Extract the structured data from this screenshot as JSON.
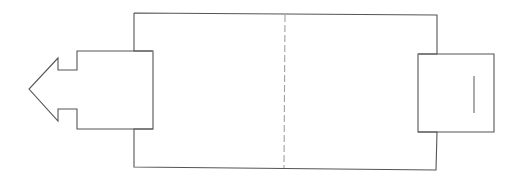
{
  "diagram": {
    "title": "",
    "colors": {
      "background": "#ffffff",
      "stroke": "#555555",
      "dashed_stroke": "#a0a0a0",
      "marker_stroke": "#666666"
    },
    "main_box": {
      "points": "134,13 437,15 437,54 418,54 418,132 437,132 436,170 134,167 134,129 153,129 153,51 134,51 134,13",
      "center_fold_line": {
        "x1": 285,
        "y1": 15,
        "x2": 284,
        "y2": 168
      }
    },
    "left_arrow_tab": {
      "outline": "153,51 77,51 77,70 58,70 58,58 29,89 58,121 58,109 77,109 77,129 153,129",
      "fold_line": {
        "x1": 153,
        "y1": 51,
        "x2": 153,
        "y2": 129
      }
    },
    "right_tab": {
      "outline": "418,54 494,54 494,132 418,132",
      "fold_line": {
        "x1": 418,
        "y1": 54,
        "x2": 418,
        "y2": 132
      },
      "slot_line": {
        "x1": 474,
        "y1": 76,
        "x2": 474,
        "y2": 113
      }
    }
  }
}
